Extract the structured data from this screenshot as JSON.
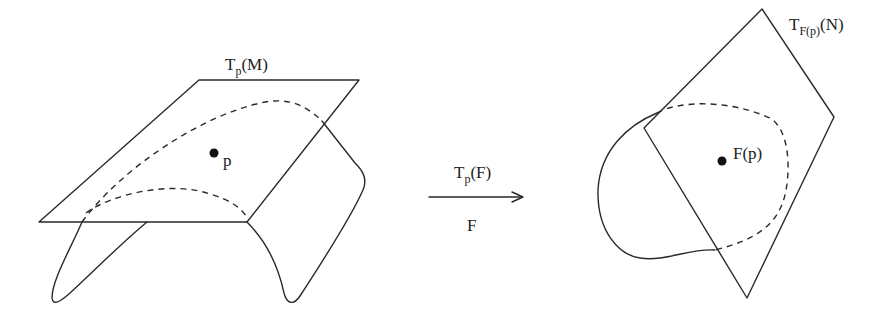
{
  "diagram": {
    "left": {
      "plane_label": {
        "base": "T",
        "sub": "p",
        "arg": "(M)"
      },
      "point_label": "p"
    },
    "arrow": {
      "top_label": {
        "base": "T",
        "sub": "p",
        "arg": "(F)"
      },
      "bottom_label": "F"
    },
    "right": {
      "plane_label": {
        "base": "T",
        "sub": "F(p)",
        "arg": "(N)"
      },
      "point_label": "F(p)"
    },
    "colors": {
      "stroke": "#2a2a2a",
      "background": "#ffffff"
    }
  }
}
